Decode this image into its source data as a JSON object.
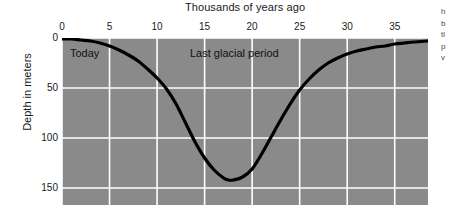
{
  "chart_data": {
    "type": "line",
    "title": "Thousands of years ago",
    "xlabel": "Thousands of years ago",
    "ylabel": "Depth in meters",
    "xlim": [
      0,
      38.5
    ],
    "ylim": [
      0,
      167
    ],
    "y_inverted": true,
    "grid": true,
    "legend": "none",
    "plot_background_color": "#8a8a8a",
    "gridline_color": "#ffffff",
    "line_color": "#000000",
    "xticks": [
      0,
      5,
      10,
      15,
      20,
      25,
      30,
      35
    ],
    "xtick_labels": [
      "0",
      "5",
      "10",
      "15",
      "20",
      "25",
      "30",
      "35"
    ],
    "yticks": [
      0,
      50,
      100,
      150
    ],
    "ytick_labels": [
      "0",
      "50",
      "100",
      "150"
    ],
    "series": [
      {
        "name": "Sea level depth",
        "x": [
          0,
          1,
          2,
          3,
          4,
          5,
          6,
          7,
          8,
          9,
          10,
          11,
          12,
          13,
          14,
          15,
          16,
          17,
          17.5,
          18,
          19,
          20,
          21,
          22,
          23,
          24,
          25,
          26,
          27,
          28,
          29,
          30,
          31,
          32,
          33,
          34,
          35,
          36,
          37,
          38.5
        ],
        "y": [
          1,
          1,
          2,
          3,
          5,
          8,
          12,
          17,
          23,
          31,
          40,
          51,
          66,
          85,
          104,
          120,
          132,
          140,
          142,
          142,
          139,
          131,
          116,
          99,
          82,
          66,
          52,
          41,
          32,
          25,
          20,
          16,
          13,
          11,
          9,
          8,
          6,
          5,
          4,
          3
        ]
      }
    ],
    "annotations": [
      {
        "text": "Today",
        "x": 0.8,
        "y": 9
      },
      {
        "text": "Last glacial period",
        "x": 13.5,
        "y": 9
      }
    ]
  },
  "margin_text": {
    "lines": [
      "h",
      "b",
      "tl",
      "p",
      "v"
    ]
  }
}
